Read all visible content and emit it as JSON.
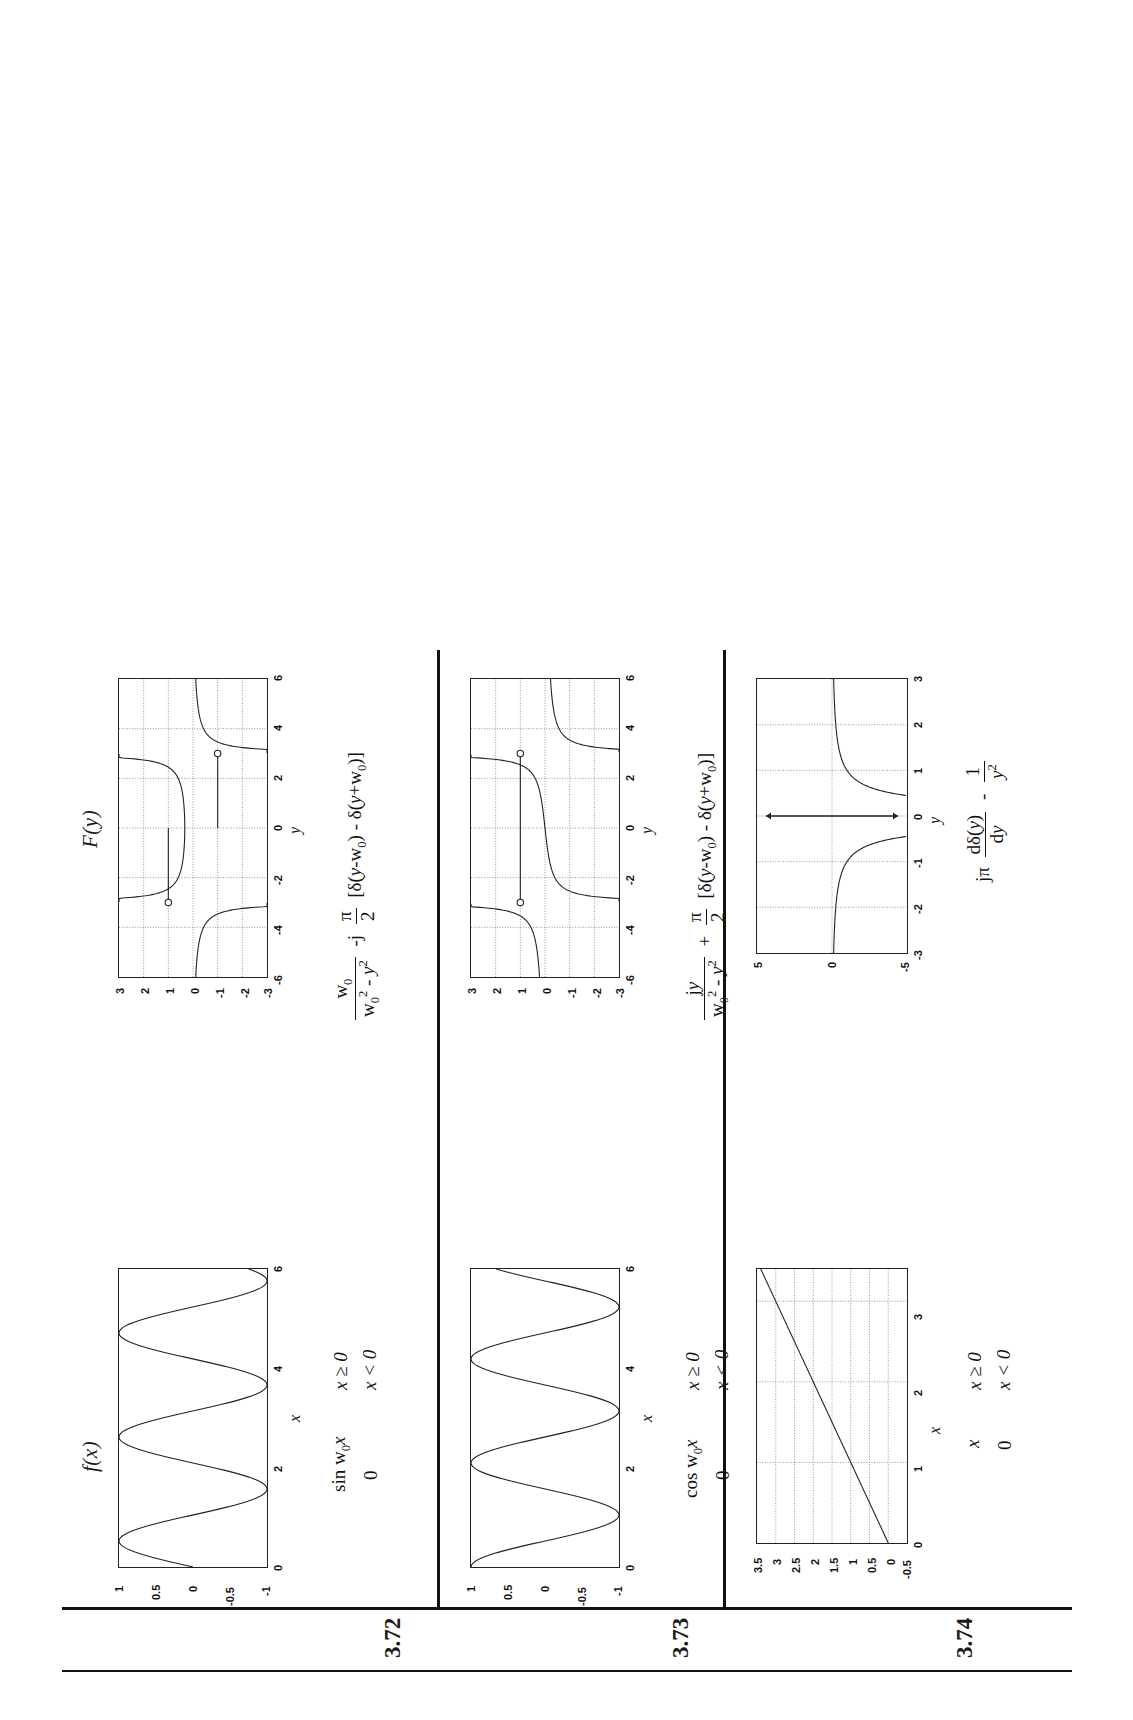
{
  "page": {
    "orientation": "landscape-rotated-90",
    "background": "#ffffff",
    "ink": "#111111"
  },
  "headers": {
    "fx": "f(x)",
    "Fy": "F(y)"
  },
  "rows": [
    {
      "number": "3.72",
      "time_formula": {
        "main": "sin w",
        "sub": "0",
        "tail": "x",
        "second": "0"
      },
      "time_conditions": [
        "x ≥ 0",
        "x < 0"
      ],
      "freq_formula_text": "w0/(w0^2 - y^2) - j (pi/2)[delta(y-w0) - delta(y+w0)]",
      "freq_parts": {
        "frac1_num": "w",
        "frac1_num_sub": "0",
        "frac1_den_a": "w",
        "frac1_den_a_sub": "0",
        "frac1_den_a_sup": "2",
        "frac1_den_b": " - y",
        "frac1_den_b_sup": "2",
        "op": "-j",
        "frac2_num": "π",
        "frac2_den": "2",
        "bracket": "[δ(y-w0) - δ(y+w0)]"
      }
    },
    {
      "number": "3.73",
      "time_formula": {
        "main": "cos w",
        "sub": "0",
        "tail": "x",
        "second": "0"
      },
      "time_conditions": [
        "x ≥ 0",
        "x < 0"
      ],
      "freq_formula_text": "jy/(w0^2 - y^2) + (pi/2)[delta(y-w0) - delta(y+w0)]",
      "freq_parts": {
        "frac1_num": "jy",
        "frac1_num_sub": "",
        "frac1_den_a": "w",
        "frac1_den_a_sub": "0",
        "frac1_den_a_sup": "2",
        "frac1_den_b": " - y",
        "frac1_den_b_sup": "2",
        "op": "+",
        "frac2_num": "π",
        "frac2_den": "2",
        "bracket": "[δ(y-w0) - δ(y+w0)]"
      }
    },
    {
      "number": "3.74",
      "time_formula": {
        "main": "x",
        "sub": "",
        "tail": "",
        "second": "0"
      },
      "time_conditions": [
        "x ≥ 0",
        "x < 0"
      ],
      "freq_formula_text": "j pi d delta(y)/dy - 1/y^2",
      "freq_parts": {
        "lead": "jπ",
        "frac1_num": "dδ(y)",
        "frac1_den": "dy",
        "op": "-",
        "frac2_num": "1",
        "frac2_den": "y",
        "frac2_den_sup": "2"
      }
    }
  ],
  "charts": [
    {
      "id": "fx-3-72",
      "chart_data": {
        "type": "line",
        "title": "",
        "xlabel": "x",
        "ylabel": "",
        "xlim": [
          0,
          6
        ],
        "ylim": [
          -1,
          1
        ],
        "xticks": [
          0,
          2,
          4,
          6
        ],
        "xticklabels": [
          "0",
          "2",
          "4",
          "6"
        ],
        "yticks": [
          -1,
          -0.5,
          0,
          0.5,
          1
        ],
        "yticklabels": [
          "-1",
          "-0.5",
          "0",
          "0.5",
          "1"
        ],
        "grid": false,
        "series": [
          {
            "name": "sin(w0 x)",
            "expr": "sin(3x)",
            "samples": 240
          }
        ]
      }
    },
    {
      "id": "Fy-3-72",
      "chart_data": {
        "type": "line",
        "title": "",
        "xlabel": "y",
        "ylabel": "",
        "xlim": [
          -6,
          6
        ],
        "ylim": [
          -3,
          3
        ],
        "xticks": [
          -6,
          -4,
          -2,
          0,
          2,
          4,
          6
        ],
        "xticklabels": [
          "-6",
          "-4",
          "-2",
          "0",
          "2",
          "4",
          "6"
        ],
        "yticks": [
          -3,
          -2,
          -1,
          0,
          1,
          2,
          3
        ],
        "yticklabels": [
          "-3",
          "-2",
          "-1",
          "0",
          "1",
          "2",
          "3"
        ],
        "grid": true,
        "series": [
          {
            "name": "w0/(w0^2-y^2)",
            "expr": "3/(9-y*y)",
            "w0": 3,
            "samples": 480
          }
        ],
        "annotations": [
          {
            "type": "open-circle-with-stem",
            "x": -3,
            "y": 1
          },
          {
            "type": "open-circle-with-stem",
            "x": 3,
            "y": -1
          }
        ]
      }
    },
    {
      "id": "fx-3-73",
      "chart_data": {
        "type": "line",
        "title": "",
        "xlabel": "x",
        "ylabel": "",
        "xlim": [
          0,
          6
        ],
        "ylim": [
          -1,
          1
        ],
        "xticks": [
          0,
          2,
          4,
          6
        ],
        "xticklabels": [
          "0",
          "2",
          "4",
          "6"
        ],
        "yticks": [
          -1,
          -0.5,
          0,
          0.5,
          1
        ],
        "yticklabels": [
          "-1",
          "-0.5",
          "0",
          "0.5",
          "1"
        ],
        "grid": false,
        "series": [
          {
            "name": "cos(w0 x)",
            "expr": "cos(3x)",
            "samples": 240
          }
        ]
      }
    },
    {
      "id": "Fy-3-73",
      "chart_data": {
        "type": "line",
        "title": "",
        "xlabel": "y",
        "ylabel": "",
        "xlim": [
          -6,
          6
        ],
        "ylim": [
          -3,
          3
        ],
        "xticks": [
          -6,
          -4,
          -2,
          0,
          2,
          4,
          6
        ],
        "xticklabels": [
          "-6",
          "-4",
          "-2",
          "0",
          "2",
          "4",
          "6"
        ],
        "yticks": [
          -3,
          -2,
          -1,
          0,
          1,
          2,
          3
        ],
        "yticklabels": [
          "-3",
          "-2",
          "-1",
          "0",
          "1",
          "2",
          "3"
        ],
        "grid": true,
        "series": [
          {
            "name": "jy/(w0^2-y^2)",
            "expr": "y/(9-y*y)",
            "w0": 3,
            "samples": 480
          }
        ],
        "annotations": [
          {
            "type": "open-circle-with-stem",
            "x": -3,
            "y": 1
          },
          {
            "type": "open-circle-with-stem",
            "x": 3,
            "y": 1
          }
        ]
      }
    },
    {
      "id": "fx-3-74",
      "chart_data": {
        "type": "line",
        "title": "",
        "xlabel": "x",
        "ylabel": "",
        "xlim": [
          0,
          3.4
        ],
        "ylim": [
          -0.5,
          3.5
        ],
        "xticks": [
          0,
          1,
          2,
          3
        ],
        "xticklabels": [
          "0",
          "1",
          "2",
          "3"
        ],
        "yticks": [
          -0.5,
          0,
          0.5,
          1,
          1.5,
          2,
          2.5,
          3,
          3.5
        ],
        "yticklabels": [
          "-0.5",
          "0",
          "0.5",
          "1",
          "1.5",
          "2",
          "2.5",
          "3",
          "3.5"
        ],
        "grid": true,
        "series": [
          {
            "name": "x",
            "expr": "x",
            "samples": 2
          }
        ]
      }
    },
    {
      "id": "Fy-3-74",
      "chart_data": {
        "type": "line",
        "title": "",
        "xlabel": "y",
        "ylabel": "",
        "xlim": [
          -3,
          3
        ],
        "ylim": [
          -5,
          5
        ],
        "xticks": [
          -3,
          -2,
          -1,
          0,
          1,
          2,
          3
        ],
        "xticklabels": [
          "-3",
          "-2",
          "-1",
          "0",
          "1",
          "2",
          "3"
        ],
        "yticks": [
          -5,
          0,
          5
        ],
        "yticklabels": [
          "-5",
          "0",
          "5"
        ],
        "grid": true,
        "series": [
          {
            "name": "-1/y^2",
            "expr": "-1/(y*y)",
            "samples": 400
          }
        ],
        "annotations": [
          {
            "type": "doublet-arrow",
            "x": 0,
            "y": 0
          }
        ]
      }
    }
  ]
}
